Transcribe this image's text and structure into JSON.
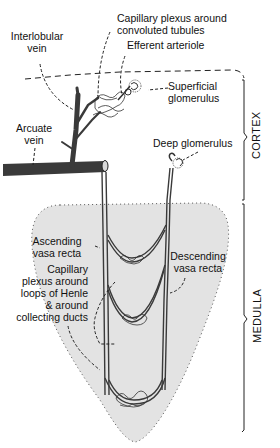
{
  "diagram": {
    "labels": {
      "interlobular_vein": "Interlobular\nvein",
      "capillary_plexus_tubules": "Capillary plexus around\nconvoluted tubules",
      "efferent_arteriole": "Efferent arteriole",
      "superficial_glomerulus": "Superficial\nglomerulus",
      "arcuate_vein": "Arcuate\nvein",
      "deep_glomerulus": "Deep glomerulus",
      "ascending_vasa_recta": "Ascending\nvasa recta",
      "descending_vasa_recta": "Descending\nvasa recta",
      "capillary_plexus_henle": "Capillary\nplexus around\nloops of Henle\n& around\ncollecting ducts"
    },
    "regions": {
      "cortex": "CORTEX",
      "medulla": "MEDULLA"
    },
    "colors": {
      "vessel": "#3a3a3a",
      "medulla_fill": "#e3e3e3",
      "line": "#222222",
      "background": "#ffffff"
    }
  }
}
